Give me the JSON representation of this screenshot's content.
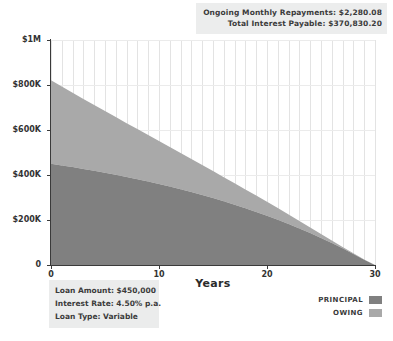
{
  "summary": {
    "repayments_line": "Ongoing Monthly Repayments: $2,280.08",
    "interest_line": "Total Interest Payable: $370,830.20"
  },
  "loan_details": {
    "amount_line": "Loan Amount: $450,000",
    "rate_line": "Interest Rate: 4.50% p.a.",
    "type_line": "Loan Type: Variable"
  },
  "legend": {
    "items": [
      {
        "label": "PRINCIPAL",
        "color": "#808080"
      },
      {
        "label": "OWING",
        "color": "#a9a9a9"
      }
    ]
  },
  "colors": {
    "principal": "#808080",
    "owing": "#a9a9a9",
    "panel_bg": "#ebecec",
    "axis": "#3a3a3a",
    "gridline": "#e3e3e3"
  },
  "chart_data": {
    "type": "area",
    "title": "",
    "xlabel": "Years",
    "ylabel": "",
    "xlim": [
      0,
      30
    ],
    "ylim": [
      0,
      1000000
    ],
    "grid": true,
    "stacked": true,
    "legend_position": "bottom-right",
    "xticks": [
      0,
      10,
      20,
      30
    ],
    "xticklabels": [
      "0",
      "10",
      "20",
      "30"
    ],
    "yticks": [
      0,
      200000,
      400000,
      600000,
      800000,
      1000000
    ],
    "yticklabels": [
      "0",
      "$200K",
      "$400K",
      "$600K",
      "$800K",
      "$1M"
    ],
    "x": [
      0,
      1,
      2,
      3,
      4,
      5,
      6,
      7,
      8,
      9,
      10,
      11,
      12,
      13,
      14,
      15,
      16,
      17,
      18,
      19,
      20,
      21,
      22,
      23,
      24,
      25,
      26,
      27,
      28,
      29,
      30
    ],
    "series": [
      {
        "name": "PRINCIPAL",
        "color": "#808080",
        "values": [
          450000,
          442700,
          435100,
          427100,
          418700,
          410000,
          400900,
          391300,
          381400,
          370900,
          360000,
          348600,
          336700,
          324200,
          311100,
          297400,
          283100,
          268100,
          252400,
          236000,
          218800,
          200800,
          182000,
          162300,
          141700,
          120100,
          97600,
          74000,
          49300,
          23400,
          0
        ]
      },
      {
        "name": "OWING",
        "color": "#a9a9a9",
        "values": [
          370830,
          350300,
          330400,
          311100,
          292300,
          274100,
          256400,
          239200,
          222500,
          206400,
          190700,
          175600,
          160900,
          146800,
          133100,
          120000,
          107400,
          95300,
          83700,
          72600,
          62000,
          52000,
          42500,
          33500,
          25100,
          17300,
          11000,
          6100,
          2600,
          600,
          0
        ]
      }
    ]
  }
}
